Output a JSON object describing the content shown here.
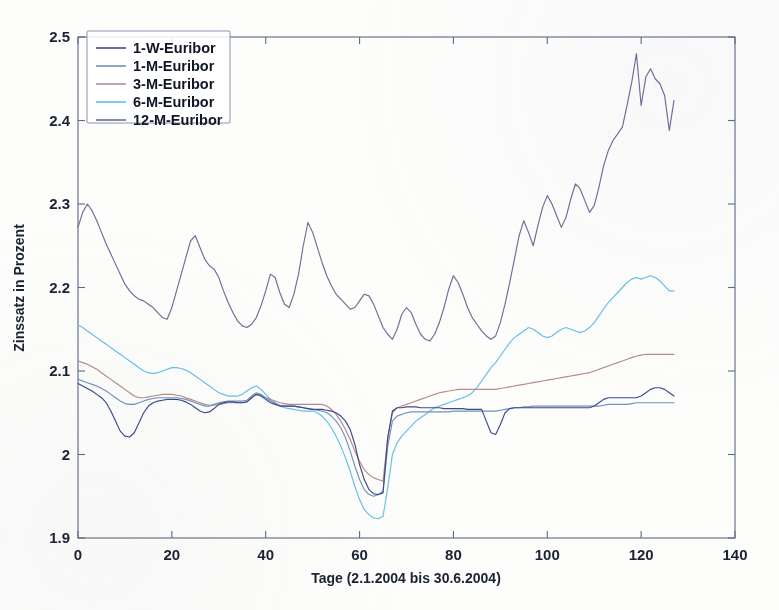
{
  "chart_data": {
    "type": "line",
    "title": "",
    "xlabel": "Tage (2.1.2004 bis 30.6.2004)",
    "ylabel": "Zinssatz in Prozent",
    "xlim": [
      0,
      140
    ],
    "ylim": [
      1.9,
      2.5
    ],
    "xticks": [
      0,
      20,
      40,
      60,
      80,
      100,
      120,
      140
    ],
    "yticks": [
      1.9,
      2,
      2.1,
      2.2,
      2.3,
      2.4,
      2.5
    ],
    "xticklabels": [
      "0",
      "20",
      "40",
      "60",
      "80",
      "100",
      "120",
      "140"
    ],
    "yticklabels": [
      "1.9",
      "2",
      "2.1",
      "2.2",
      "2.3",
      "2.4",
      "2.5"
    ],
    "grid": false,
    "legend_position": "upper-left",
    "legend_entries": [
      "1-W-Euribor",
      "1-M-Euribor",
      "3-M-Euribor",
      "6-M-Euribor",
      "12-M-Euribor"
    ],
    "colors": {
      "1-W-Euribor": "#3b4a8c",
      "1-M-Euribor": "#6f94b8",
      "3-M-Euribor": "#b98a8c",
      "6-M-Euribor": "#63c0e6",
      "12-M-Euribor": "#6a6f96"
    },
    "x": [
      0,
      1,
      2,
      3,
      4,
      5,
      6,
      7,
      8,
      9,
      10,
      11,
      12,
      13,
      14,
      15,
      16,
      17,
      18,
      19,
      20,
      21,
      22,
      23,
      24,
      25,
      26,
      27,
      28,
      29,
      30,
      31,
      32,
      33,
      34,
      35,
      36,
      37,
      38,
      39,
      40,
      41,
      42,
      43,
      44,
      45,
      46,
      47,
      48,
      49,
      50,
      51,
      52,
      53,
      54,
      55,
      56,
      57,
      58,
      59,
      60,
      61,
      62,
      63,
      64,
      65,
      66,
      67,
      68,
      69,
      70,
      71,
      72,
      73,
      74,
      75,
      76,
      77,
      78,
      79,
      80,
      81,
      82,
      83,
      84,
      85,
      86,
      87,
      88,
      89,
      90,
      91,
      92,
      93,
      94,
      95,
      96,
      97,
      98,
      99,
      100,
      101,
      102,
      103,
      104,
      105,
      106,
      107,
      108,
      109,
      110,
      111,
      112,
      113,
      114,
      115,
      116,
      117,
      118,
      119,
      120,
      121,
      122,
      123,
      124,
      125,
      126,
      127
    ],
    "series": [
      {
        "name": "1-W-Euribor",
        "color": "#3b4a8c",
        "values": [
          2.085,
          2.082,
          2.079,
          2.076,
          2.072,
          2.068,
          2.062,
          2.052,
          2.04,
          2.028,
          2.022,
          2.021,
          2.026,
          2.038,
          2.05,
          2.058,
          2.062,
          2.064,
          2.065,
          2.066,
          2.066,
          2.066,
          2.065,
          2.063,
          2.06,
          2.056,
          2.052,
          2.05,
          2.051,
          2.055,
          2.06,
          2.062,
          2.063,
          2.063,
          2.062,
          2.062,
          2.063,
          2.068,
          2.072,
          2.07,
          2.066,
          2.062,
          2.06,
          2.058,
          2.058,
          2.058,
          2.058,
          2.057,
          2.056,
          2.055,
          2.054,
          2.054,
          2.054,
          2.053,
          2.052,
          2.05,
          2.046,
          2.04,
          2.03,
          2.012,
          1.988,
          1.97,
          1.958,
          1.953,
          1.952,
          1.954,
          2.02,
          2.052,
          2.056,
          2.056,
          2.057,
          2.057,
          2.057,
          2.056,
          2.056,
          2.056,
          2.056,
          2.056,
          2.055,
          2.055,
          2.055,
          2.055,
          2.055,
          2.054,
          2.054,
          2.054,
          2.054,
          2.04,
          2.026,
          2.024,
          2.036,
          2.05,
          2.055,
          2.056,
          2.056,
          2.056,
          2.056,
          2.056,
          2.056,
          2.056,
          2.056,
          2.056,
          2.056,
          2.056,
          2.056,
          2.056,
          2.056,
          2.056,
          2.056,
          2.056,
          2.058,
          2.062,
          2.066,
          2.068,
          2.068,
          2.068,
          2.068,
          2.068,
          2.068,
          2.068,
          2.07,
          2.074,
          2.078,
          2.08,
          2.08,
          2.078,
          2.074,
          2.07
        ]
      },
      {
        "name": "1-M-Euribor",
        "color": "#6f94b8",
        "values": [
          2.09,
          2.088,
          2.086,
          2.084,
          2.082,
          2.079,
          2.076,
          2.072,
          2.068,
          2.064,
          2.061,
          2.06,
          2.06,
          2.062,
          2.064,
          2.066,
          2.067,
          2.068,
          2.068,
          2.068,
          2.068,
          2.068,
          2.067,
          2.066,
          2.064,
          2.062,
          2.06,
          2.058,
          2.058,
          2.06,
          2.062,
          2.063,
          2.064,
          2.064,
          2.064,
          2.064,
          2.065,
          2.07,
          2.074,
          2.072,
          2.068,
          2.064,
          2.061,
          2.059,
          2.058,
          2.058,
          2.058,
          2.057,
          2.056,
          2.055,
          2.054,
          2.053,
          2.052,
          2.05,
          2.046,
          2.04,
          2.032,
          2.02,
          2.004,
          1.986,
          1.97,
          1.958,
          1.952,
          1.95,
          1.952,
          1.956,
          2.01,
          2.04,
          2.046,
          2.048,
          2.05,
          2.051,
          2.051,
          2.051,
          2.051,
          2.051,
          2.051,
          2.051,
          2.051,
          2.051,
          2.052,
          2.052,
          2.052,
          2.052,
          2.052,
          2.052,
          2.052,
          2.052,
          2.052,
          2.052,
          2.053,
          2.054,
          2.055,
          2.056,
          2.056,
          2.057,
          2.057,
          2.058,
          2.058,
          2.058,
          2.058,
          2.058,
          2.058,
          2.058,
          2.058,
          2.058,
          2.058,
          2.058,
          2.058,
          2.058,
          2.058,
          2.058,
          2.059,
          2.06,
          2.06,
          2.06,
          2.06,
          2.06,
          2.061,
          2.062,
          2.062,
          2.062,
          2.062,
          2.062,
          2.062,
          2.062,
          2.062,
          2.062
        ]
      },
      {
        "name": "3-M-Euribor",
        "color": "#b98a8c",
        "values": [
          2.112,
          2.11,
          2.108,
          2.105,
          2.102,
          2.098,
          2.094,
          2.09,
          2.086,
          2.082,
          2.078,
          2.074,
          2.07,
          2.068,
          2.068,
          2.069,
          2.07,
          2.071,
          2.072,
          2.072,
          2.072,
          2.071,
          2.07,
          2.068,
          2.066,
          2.064,
          2.062,
          2.06,
          2.059,
          2.059,
          2.06,
          2.061,
          2.062,
          2.062,
          2.062,
          2.062,
          2.063,
          2.068,
          2.072,
          2.071,
          2.068,
          2.066,
          2.064,
          2.062,
          2.061,
          2.06,
          2.06,
          2.06,
          2.06,
          2.06,
          2.06,
          2.06,
          2.06,
          2.058,
          2.054,
          2.048,
          2.04,
          2.03,
          2.018,
          2.004,
          1.992,
          1.982,
          1.976,
          1.972,
          1.97,
          1.968,
          2.02,
          2.05,
          2.056,
          2.058,
          2.06,
          2.062,
          2.064,
          2.066,
          2.068,
          2.07,
          2.072,
          2.074,
          2.075,
          2.076,
          2.077,
          2.078,
          2.078,
          2.078,
          2.078,
          2.078,
          2.078,
          2.078,
          2.078,
          2.078,
          2.079,
          2.08,
          2.081,
          2.082,
          2.083,
          2.084,
          2.085,
          2.086,
          2.087,
          2.088,
          2.089,
          2.09,
          2.091,
          2.092,
          2.093,
          2.094,
          2.095,
          2.096,
          2.097,
          2.098,
          2.1,
          2.102,
          2.104,
          2.106,
          2.108,
          2.11,
          2.112,
          2.114,
          2.116,
          2.118,
          2.119,
          2.12,
          2.12,
          2.12,
          2.12,
          2.12,
          2.12,
          2.12
        ]
      },
      {
        "name": "6-M-Euribor",
        "color": "#63c0e6",
        "values": [
          2.155,
          2.152,
          2.148,
          2.144,
          2.14,
          2.136,
          2.132,
          2.128,
          2.124,
          2.12,
          2.116,
          2.112,
          2.108,
          2.104,
          2.1,
          2.098,
          2.097,
          2.098,
          2.1,
          2.102,
          2.104,
          2.104,
          2.103,
          2.101,
          2.098,
          2.094,
          2.09,
          2.086,
          2.082,
          2.078,
          2.074,
          2.072,
          2.07,
          2.07,
          2.07,
          2.072,
          2.076,
          2.08,
          2.082,
          2.078,
          2.072,
          2.066,
          2.062,
          2.058,
          2.056,
          2.055,
          2.054,
          2.053,
          2.052,
          2.052,
          2.052,
          2.05,
          2.046,
          2.04,
          2.032,
          2.022,
          2.01,
          1.996,
          1.98,
          1.962,
          1.946,
          1.934,
          1.928,
          1.924,
          1.923,
          1.926,
          1.96,
          2.0,
          2.014,
          2.022,
          2.028,
          2.034,
          2.04,
          2.044,
          2.048,
          2.052,
          2.056,
          2.058,
          2.06,
          2.062,
          2.064,
          2.066,
          2.068,
          2.07,
          2.074,
          2.08,
          2.088,
          2.096,
          2.104,
          2.11,
          2.118,
          2.126,
          2.134,
          2.14,
          2.144,
          2.148,
          2.152,
          2.15,
          2.146,
          2.142,
          2.14,
          2.142,
          2.146,
          2.15,
          2.152,
          2.15,
          2.148,
          2.146,
          2.148,
          2.152,
          2.158,
          2.166,
          2.174,
          2.182,
          2.188,
          2.194,
          2.2,
          2.206,
          2.21,
          2.212,
          2.21,
          2.212,
          2.214,
          2.212,
          2.208,
          2.202,
          2.196,
          2.196
        ]
      },
      {
        "name": "12-M-Euribor",
        "color": "#6a6f96",
        "values": [
          2.272,
          2.29,
          2.3,
          2.292,
          2.28,
          2.266,
          2.252,
          2.24,
          2.228,
          2.216,
          2.204,
          2.196,
          2.19,
          2.186,
          2.184,
          2.18,
          2.176,
          2.17,
          2.164,
          2.162,
          2.176,
          2.196,
          2.216,
          2.236,
          2.256,
          2.262,
          2.248,
          2.234,
          2.226,
          2.222,
          2.212,
          2.196,
          2.182,
          2.17,
          2.16,
          2.154,
          2.152,
          2.156,
          2.164,
          2.178,
          2.196,
          2.216,
          2.212,
          2.194,
          2.18,
          2.176,
          2.192,
          2.216,
          2.25,
          2.278,
          2.266,
          2.248,
          2.23,
          2.214,
          2.202,
          2.192,
          2.186,
          2.18,
          2.174,
          2.176,
          2.184,
          2.192,
          2.19,
          2.18,
          2.166,
          2.152,
          2.144,
          2.138,
          2.15,
          2.168,
          2.176,
          2.17,
          2.156,
          2.144,
          2.138,
          2.136,
          2.144,
          2.158,
          2.176,
          2.198,
          2.214,
          2.206,
          2.192,
          2.176,
          2.164,
          2.156,
          2.148,
          2.142,
          2.138,
          2.142,
          2.158,
          2.18,
          2.206,
          2.234,
          2.262,
          2.28,
          2.266,
          2.25,
          2.274,
          2.296,
          2.31,
          2.3,
          2.286,
          2.272,
          2.284,
          2.306,
          2.324,
          2.318,
          2.304,
          2.29,
          2.298,
          2.32,
          2.346,
          2.364,
          2.376,
          2.384,
          2.392,
          2.418,
          2.446,
          2.48,
          2.418,
          2.452,
          2.462,
          2.45,
          2.444,
          2.43,
          2.388,
          2.424
        ]
      }
    ]
  },
  "axes": {
    "ylabel": "Zinssatz in Prozent",
    "xlabel": "Tage (2.1.2004 bis 30.6.2004)"
  }
}
